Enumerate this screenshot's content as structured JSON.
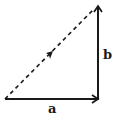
{
  "diagram": {
    "type": "vector-addition-triangle",
    "vectors": [
      {
        "id": "a",
        "label": "a",
        "from": [
          5,
          99
        ],
        "to": [
          98,
          99
        ],
        "style": "solid"
      },
      {
        "id": "b",
        "label": "b",
        "from": [
          98,
          99
        ],
        "to": [
          98,
          6
        ],
        "style": "solid"
      },
      {
        "id": "resultant",
        "label": "",
        "from": [
          5,
          99
        ],
        "to": [
          93,
          10
        ],
        "style": "dashed"
      }
    ],
    "labels": {
      "a": "a",
      "b": "b"
    },
    "colors": {
      "stroke": "#1a1a1a",
      "background": "#ffffff"
    }
  }
}
